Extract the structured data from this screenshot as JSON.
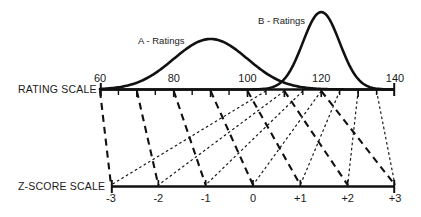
{
  "figure": {
    "background_color": "#ffffff",
    "ink_color": "#1a1a1a"
  },
  "rating_axis": {
    "name": "RATING SCALE",
    "labels": [
      "60",
      "80",
      "100",
      "120",
      "140"
    ],
    "tick_values": [
      60,
      65,
      70,
      75,
      80,
      85,
      90,
      95,
      100,
      105,
      110,
      115,
      120,
      125,
      130,
      135,
      140
    ]
  },
  "zscore_axis": {
    "name": "Z-SCORE SCALE",
    "labels": [
      "-3",
      "-2",
      "-1",
      "0",
      "+1",
      "+2",
      "+3"
    ],
    "tick_values": [
      -3,
      -2,
      -1,
      0,
      1,
      2,
      3
    ]
  },
  "curves": [
    {
      "label": "A - Ratings",
      "mean": 90,
      "sd": 10,
      "style": "dashed-thick"
    },
    {
      "label": "B - Ratings",
      "mean": 120,
      "sd": 5,
      "style": "dotted-thin"
    }
  ],
  "chart_data": {
    "type": "line",
    "title": "",
    "xlabel": "RATING SCALE",
    "ylabel": "",
    "xlim": [
      60,
      140
    ],
    "grid": false,
    "legend_position": "inline-annotation",
    "secondary_axis": {
      "label": "Z-SCORE SCALE",
      "ticks": [
        -3,
        -2,
        -1,
        0,
        1,
        2,
        3
      ]
    },
    "annotations": [
      "A - Ratings",
      "B - Ratings"
    ],
    "series": [
      {
        "name": "A - Ratings",
        "mean": 90,
        "sd": 10,
        "peak_x": 90,
        "zscore_mapping": [
          {
            "z": -3,
            "rating": 60
          },
          {
            "z": -2,
            "rating": 70
          },
          {
            "z": -1,
            "rating": 80
          },
          {
            "z": 0,
            "rating": 90
          },
          {
            "z": 1,
            "rating": 100
          },
          {
            "z": 2,
            "rating": 110
          },
          {
            "z": 3,
            "rating": 120
          }
        ]
      },
      {
        "name": "B - Ratings",
        "mean": 120,
        "sd": 5,
        "peak_x": 120,
        "zscore_mapping": [
          {
            "z": -3,
            "rating": 105
          },
          {
            "z": -2,
            "rating": 110
          },
          {
            "z": -1,
            "rating": 115
          },
          {
            "z": 0,
            "rating": 120
          },
          {
            "z": 1,
            "rating": 125
          },
          {
            "z": 2,
            "rating": 130
          },
          {
            "z": 3,
            "rating": 135
          }
        ]
      }
    ]
  }
}
